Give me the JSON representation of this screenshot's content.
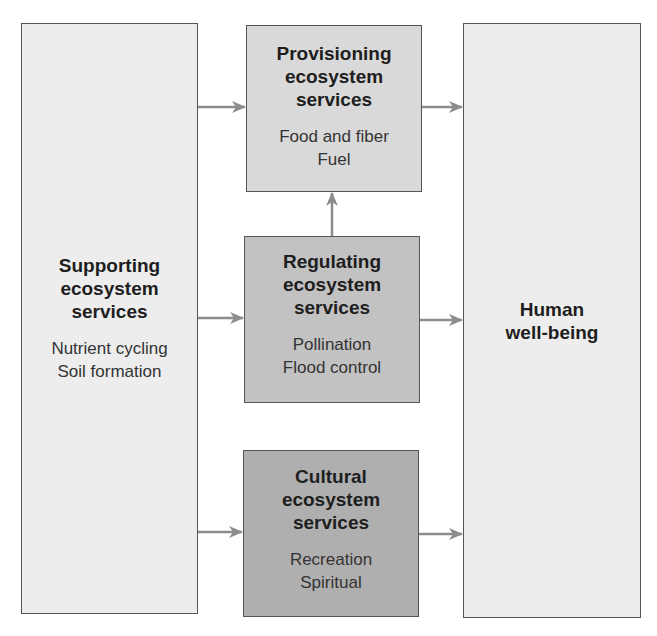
{
  "diagram": {
    "type": "flow",
    "colors": {
      "arrow": "#8c8c8c",
      "border": "#555555",
      "supporting_fill": "#ededed",
      "provisioning_fill": "#d9d9d9",
      "regulating_fill": "#c2c2c2",
      "cultural_fill": "#afafaf",
      "wellbeing_fill": "#ededed"
    },
    "nodes": {
      "supporting": {
        "title": "Supporting\necosystem\nservices",
        "items": "Nutrient cycling\nSoil formation"
      },
      "provisioning": {
        "title": "Provisioning\necosystem\nservices",
        "items": "Food and fiber\nFuel"
      },
      "regulating": {
        "title": "Regulating\necosystem\nservices",
        "items": "Pollination\nFlood control"
      },
      "cultural": {
        "title": "Cultural\necosystem\nservices",
        "items": "Recreation\nSpiritual"
      },
      "wellbeing": {
        "title": "Human\nwell-being"
      }
    },
    "edges": [
      {
        "from": "supporting",
        "to": "provisioning"
      },
      {
        "from": "supporting",
        "to": "regulating"
      },
      {
        "from": "supporting",
        "to": "cultural"
      },
      {
        "from": "regulating",
        "to": "provisioning"
      },
      {
        "from": "provisioning",
        "to": "wellbeing"
      },
      {
        "from": "regulating",
        "to": "wellbeing"
      },
      {
        "from": "cultural",
        "to": "wellbeing"
      }
    ]
  }
}
